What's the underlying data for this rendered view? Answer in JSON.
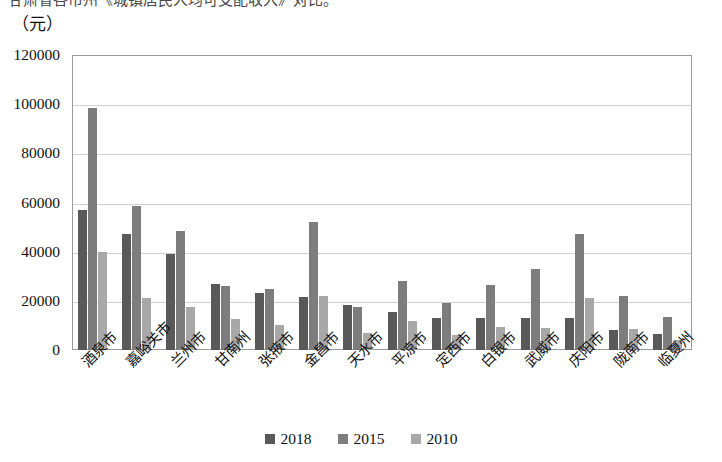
{
  "top_caption": "甘肃省各市州《城镇居民人均可支配收入》对比。",
  "unit_label": "（元）",
  "chart_data": {
    "type": "bar",
    "title": "",
    "xlabel": "",
    "ylabel": "（元）",
    "ylim": [
      0,
      120000
    ],
    "ytick_labels": [
      "0",
      "20000",
      "40000",
      "60000",
      "80000",
      "100000",
      "120000"
    ],
    "ytick_values": [
      0,
      20000,
      40000,
      60000,
      80000,
      100000,
      120000
    ],
    "grid": true,
    "legend_position": "bottom-center",
    "categories": [
      "酒泉市",
      "嘉峪关市",
      "兰州市",
      "甘南州",
      "张掖市",
      "金昌市",
      "天水市",
      "平凉市",
      "定西市",
      "白银市",
      "武威市",
      "庆阳市",
      "陇南市",
      "临夏州"
    ],
    "series": [
      {
        "name": "2018",
        "color": "#595959",
        "values": [
          57000,
          47000,
          39000,
          27000,
          23000,
          21500,
          18500,
          15500,
          13000,
          13000,
          13000,
          13000,
          8000,
          6500
        ]
      },
      {
        "name": "2015",
        "color": "#7d7d7d",
        "values": [
          98500,
          58500,
          48500,
          26000,
          25000,
          52000,
          17500,
          28000,
          19000,
          26500,
          33000,
          47000,
          22000,
          13500
        ]
      },
      {
        "name": "2010",
        "color": "#a8a8a8",
        "values": [
          40000,
          21000,
          17500,
          12500,
          10000,
          22000,
          7000,
          12000,
          6000,
          9500,
          9000,
          21000,
          8500,
          4000
        ]
      }
    ]
  },
  "legend": [
    {
      "label": "2018",
      "color": "#595959"
    },
    {
      "label": "2015",
      "color": "#7d7d7d"
    },
    {
      "label": "2010",
      "color": "#a8a8a8"
    }
  ]
}
